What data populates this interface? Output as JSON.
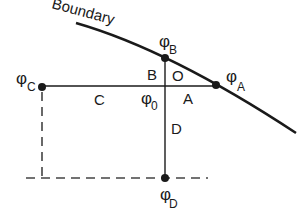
{
  "diagram": {
    "boundary_label": "Boundary",
    "colors": {
      "ink": "#1a1a1a",
      "dashed": "#444444",
      "background": "#ffffff"
    },
    "nodes": {
      "phi_A": {
        "symbol": "φ",
        "subscript": "A"
      },
      "phi_B": {
        "symbol": "φ",
        "subscript": "B"
      },
      "phi_C": {
        "symbol": "φ",
        "subscript": "C"
      },
      "phi_D": {
        "symbol": "φ",
        "subscript": "D"
      },
      "phi_0": {
        "symbol": "φ",
        "subscript": "0"
      }
    },
    "segment_labels": {
      "A": "A",
      "B": "B",
      "C": "C",
      "D": "D",
      "O": "O"
    }
  }
}
